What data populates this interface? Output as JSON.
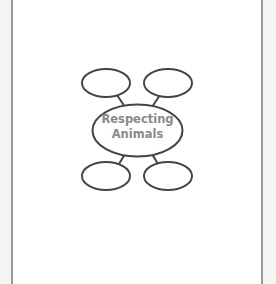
{
  "diagram": {
    "type": "mind-map",
    "center": {
      "line1": "Respecting",
      "line2": "Animals"
    },
    "branches": [
      {
        "position": "top-left",
        "label": ""
      },
      {
        "position": "top-right",
        "label": ""
      },
      {
        "position": "bottom-left",
        "label": ""
      },
      {
        "position": "bottom-right",
        "label": ""
      }
    ],
    "colors": {
      "outline": "#444444",
      "text": "#8a8a8a",
      "border": "#9a9a9a",
      "background": "#ffffff"
    }
  }
}
